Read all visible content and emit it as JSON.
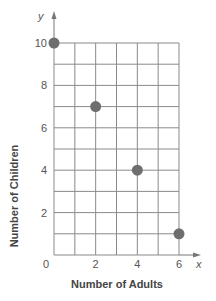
{
  "chart_data": {
    "type": "scatter",
    "title": "",
    "xlabel": "Number of Adults",
    "ylabel": "Number of Children",
    "x_var": "x",
    "y_var": "y",
    "xlim": [
      0,
      6
    ],
    "ylim": [
      0,
      10
    ],
    "x_ticks": [
      "0",
      "2",
      "4",
      "6"
    ],
    "y_ticks": [
      "2",
      "4",
      "6",
      "8",
      "10"
    ],
    "grid": true,
    "points": [
      {
        "x": 0,
        "y": 10
      },
      {
        "x": 2,
        "y": 7
      },
      {
        "x": 4,
        "y": 4
      },
      {
        "x": 6,
        "y": 1
      }
    ],
    "colors": {
      "grid": "#8a8a8a",
      "point": "#6e6e6e"
    }
  }
}
